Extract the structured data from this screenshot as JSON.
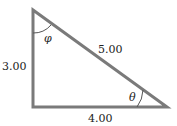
{
  "diagram": {
    "type": "right-triangle",
    "sides": {
      "vertical": "3.00",
      "horizontal": "4.00",
      "hypotenuse": "5.00"
    },
    "angles": {
      "top": "φ",
      "bottom_right": "θ"
    },
    "colors": {
      "line": "#7a7a7a",
      "text": "#222222",
      "background": "#ffffff"
    }
  }
}
